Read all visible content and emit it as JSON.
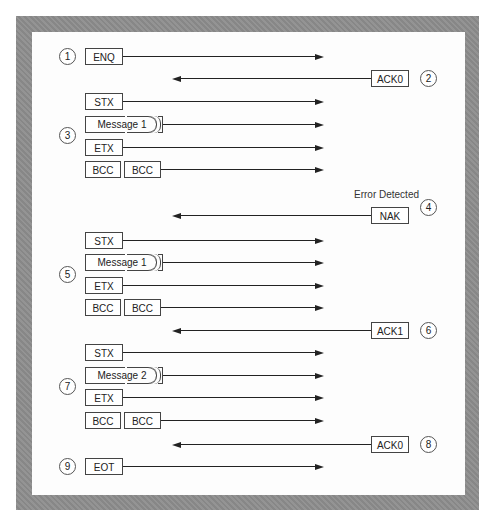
{
  "diagram": {
    "type": "sequence",
    "steps": [
      {
        "n": "1",
        "dir": "right",
        "frames": [
          "ENQ"
        ]
      },
      {
        "n": "2",
        "dir": "left",
        "frames": [
          "ACK0"
        ]
      },
      {
        "n": "3",
        "dir": "right",
        "frames": [
          "STX",
          "Message 1",
          "ETX",
          "BCC BCC"
        ]
      },
      {
        "n": "4",
        "dir": "left",
        "frames": [
          "NAK"
        ],
        "note": "Error Detected"
      },
      {
        "n": "5",
        "dir": "right",
        "frames": [
          "STX",
          "Message 1",
          "ETX",
          "BCC BCC"
        ]
      },
      {
        "n": "6",
        "dir": "left",
        "frames": [
          "ACK1"
        ]
      },
      {
        "n": "7",
        "dir": "right",
        "frames": [
          "STX",
          "Message 2",
          "ETX",
          "BCC BCC"
        ]
      },
      {
        "n": "8",
        "dir": "left",
        "frames": [
          "ACK0"
        ]
      },
      {
        "n": "9",
        "dir": "right",
        "frames": [
          "EOT"
        ]
      }
    ]
  },
  "labels": {
    "enq": "ENQ",
    "ack0": "ACK0",
    "ack1": "ACK1",
    "stx": "STX",
    "etx": "ETX",
    "bcc": "BCC",
    "nak": "NAK",
    "eot": "EOT",
    "message1": "Message 1",
    "message2": "Message 2",
    "error_detected": "Error Detected"
  },
  "step_numbers": [
    "1",
    "2",
    "3",
    "4",
    "5",
    "6",
    "7",
    "8",
    "9"
  ],
  "colors": {
    "frame": "#8e8e8e",
    "background": "#fdfdfd",
    "ink": "#222222"
  }
}
